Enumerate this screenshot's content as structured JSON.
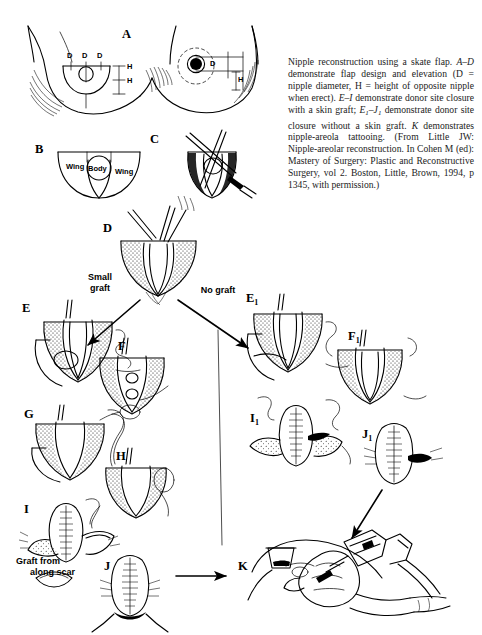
{
  "figure": {
    "title_panel_letters": [
      "A",
      "B",
      "C",
      "D",
      "E",
      "F",
      "G",
      "H",
      "I",
      "J",
      "K"
    ],
    "panel_a": {
      "label": "A",
      "dimension_labels_left": [
        "D",
        "D",
        "D",
        "H",
        "H"
      ],
      "dimension_labels_right": [
        "D",
        "H"
      ]
    },
    "panel_b": {
      "label": "B",
      "region_labels": [
        "Wing",
        "Body",
        "Wing"
      ]
    },
    "panel_c": {
      "label": "C"
    },
    "panel_d": {
      "label": "D"
    },
    "branch_left_label": "Small\ngraft",
    "branch_left_line1": "Small",
    "branch_left_line2": "graft",
    "branch_right_label": "No graft",
    "graft_note_line1": "Graft from",
    "graft_note_line2": "along scar",
    "left_column_labels": [
      "E",
      "F",
      "G",
      "H",
      "I",
      "J"
    ],
    "right_column_labels": [
      "E",
      "F",
      "I",
      "J"
    ],
    "right_column_subscript": "1",
    "panel_k": {
      "label": "K"
    }
  },
  "caption": {
    "part1": "Nipple reconstruction using a skate flap. ",
    "range_ad": "A–D",
    "part2": " demonstrate flap design and elevation (D = nipple diameter, H = height of opposite nipple when erect). ",
    "range_ei": "E–I",
    "part3": " demonstrate donor site closure with a skin graft; ",
    "range_e1": "E",
    "range_e1_sub": "1",
    "range_dash": "–",
    "range_j1": "J",
    "range_j1_sub": "1",
    "part4": " demonstrate donor site closure without a skin graft. ",
    "letter_k": "K",
    "part5": " demonstrates nipple-areola tattooing. (From Little JW: Nipple-areolar reconstruction. In Cohen M (ed): Mastery of Surgery: Plastic and Reconstructive Surgery, vol 2. Boston, Little, Brown, 1994, p 1345, with permission.)"
  },
  "colors": {
    "ink": "#000000",
    "background": "#ffffff",
    "caption_text": "#1b1b1b"
  }
}
